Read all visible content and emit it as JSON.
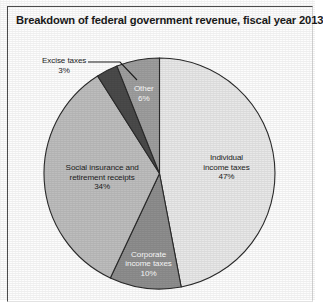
{
  "figure": {
    "title": "Breakdown of federal government revenue, fiscal year 2013",
    "background_color": "#fdfdfd",
    "frame_color": "#4c4c4c"
  },
  "chart_data": {
    "type": "pie",
    "title": "Breakdown of federal government revenue, fiscal year 2013",
    "xlabel": "",
    "ylabel": "",
    "units": "percent",
    "start_angle_deg": 0,
    "direction": "clockwise",
    "legend": "none",
    "grid": false,
    "labels": [
      "Individual income taxes",
      "Corporate income taxes",
      "Social insurance and retirement receipts",
      "Excise taxes",
      "Other"
    ],
    "values": [
      47,
      10,
      34,
      3,
      6
    ],
    "colors": [
      "#e8e8e8",
      "#8e8e8e",
      "#bdbdbd",
      "#4a4a4a",
      "#9e9e9e"
    ],
    "slices": [
      {
        "name": "individual-income-taxes",
        "label_line1": "Individual",
        "label_line2": "income taxes",
        "value_text": "47%",
        "value": 47,
        "color": "#e8e8e8",
        "label_placement": "inside",
        "text_color": "dark"
      },
      {
        "name": "corporate-income-taxes",
        "label_line1": "Corporate",
        "label_line2": "income taxes",
        "value_text": "10%",
        "value": 10,
        "color": "#8e8e8e",
        "label_placement": "inside",
        "text_color": "light"
      },
      {
        "name": "social-insurance-retirement-receipts",
        "label_line1": "Social insurance and",
        "label_line2": "retirement receipts",
        "value_text": "34%",
        "value": 34,
        "color": "#bdbdbd",
        "label_placement": "inside",
        "text_color": "dark"
      },
      {
        "name": "excise-taxes",
        "label_line1": "Excise taxes",
        "label_line2": "",
        "value_text": "3%",
        "value": 3,
        "color": "#4a4a4a",
        "label_placement": "callout",
        "text_color": "dark"
      },
      {
        "name": "other",
        "label_line1": "Other",
        "label_line2": "",
        "value_text": "6%",
        "value": 6,
        "color": "#9e9e9e",
        "label_placement": "inside",
        "text_color": "light"
      }
    ]
  }
}
